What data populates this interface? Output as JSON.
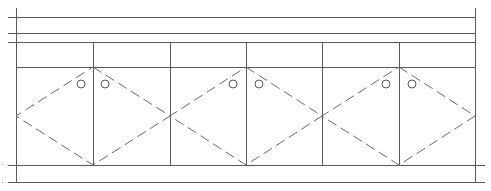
{
  "drawing": {
    "type": "elevation-line-drawing",
    "stroke_color": "#5a5a5a",
    "dash_color": "#6a6a6a",
    "background": "#ffffff",
    "frame": {
      "left_x": 16,
      "right_x": 475,
      "top_y": 8,
      "bottom_y": 182
    },
    "horizontal_lines": [
      {
        "y": 17,
        "x1": 8,
        "x2": 475
      },
      {
        "y": 33,
        "x1": 8,
        "x2": 475
      },
      {
        "y": 42,
        "x1": 8,
        "x2": 475
      },
      {
        "y": 67,
        "x1": 16,
        "x2": 475
      },
      {
        "y": 165,
        "x1": 8,
        "x2": 485
      },
      {
        "y": 182,
        "x1": 8,
        "x2": 485
      }
    ],
    "vertical_lines": [
      {
        "x": 93,
        "y1": 42,
        "y2": 165
      },
      {
        "x": 170,
        "y1": 42,
        "y2": 165
      },
      {
        "x": 246,
        "y1": 42,
        "y2": 165
      },
      {
        "x": 322,
        "y1": 42,
        "y2": 165
      },
      {
        "x": 399,
        "y1": 42,
        "y2": 165
      }
    ],
    "panels": [
      {
        "id": "panel-1",
        "center_x": 93,
        "left_x": 16,
        "right_x": 170,
        "top_y": 67,
        "mid_y": 116,
        "bottom_y": 165,
        "holes": [
          {
            "cx": 81,
            "cy": 84,
            "r": 4
          },
          {
            "cx": 105,
            "cy": 84,
            "r": 4
          }
        ]
      },
      {
        "id": "panel-2",
        "center_x": 246,
        "left_x": 170,
        "right_x": 322,
        "top_y": 67,
        "mid_y": 116,
        "bottom_y": 165,
        "holes": [
          {
            "cx": 233,
            "cy": 84,
            "r": 4
          },
          {
            "cx": 259,
            "cy": 84,
            "r": 4
          }
        ]
      },
      {
        "id": "panel-3",
        "center_x": 399,
        "left_x": 322,
        "right_x": 475,
        "top_y": 67,
        "mid_y": 116,
        "bottom_y": 165,
        "holes": [
          {
            "cx": 386,
            "cy": 84,
            "r": 4
          },
          {
            "cx": 412,
            "cy": 84,
            "r": 4
          }
        ]
      }
    ],
    "edge_marks": [
      {
        "x": 2,
        "y": 164
      },
      {
        "x": 2,
        "y": 182
      }
    ]
  }
}
